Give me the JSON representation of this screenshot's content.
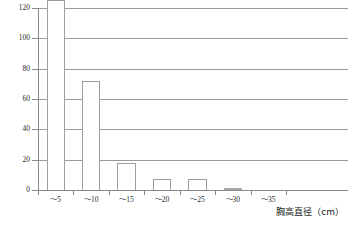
{
  "chart_data": {
    "type": "bar",
    "title": "",
    "xlabel": "胸高直径（cm）",
    "ylabel": "",
    "categories": [
      "～5",
      "～10",
      "～15",
      "～20",
      "～25",
      "～30",
      "～35"
    ],
    "values": [
      125,
      72,
      18,
      7,
      7,
      1,
      0
    ],
    "clipped_bars": [
      0
    ],
    "ylim": [
      0,
      120
    ],
    "y_ticks": [
      0,
      20,
      40,
      60,
      80,
      100,
      120
    ],
    "y_tick_labels": [
      "0",
      "20",
      "40",
      "60",
      "80",
      "100",
      "120"
    ],
    "grid": true,
    "grid_orientation": "horizontal",
    "legend": false,
    "legend_position": "none",
    "bar_face_color": "#ffffff",
    "bar_edge_color": "#9d9d9d",
    "axis_color": "#8a8a8a",
    "grid_color": "#9a9a9a",
    "text_color": "#2b2b2b",
    "background_color": "#ffffff"
  },
  "axis": {
    "x_title": "胸高直径（cm）"
  }
}
